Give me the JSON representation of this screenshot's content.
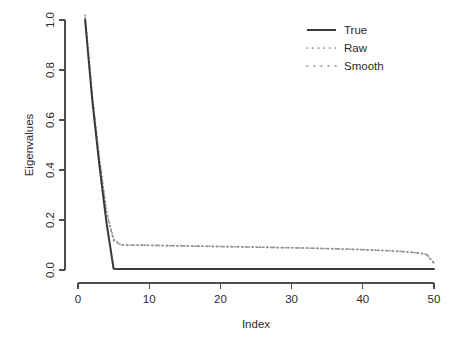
{
  "chart_data": {
    "type": "line",
    "title": "",
    "xlabel": "Index",
    "ylabel": "Eigenvalues",
    "xlim": [
      0,
      50
    ],
    "ylim": [
      0.0,
      1.0
    ],
    "grid": false,
    "legend_position": "top-right",
    "xticks": [
      "0",
      "10",
      "20",
      "30",
      "40",
      "50"
    ],
    "xtick_values": [
      0,
      10,
      20,
      30,
      40,
      50
    ],
    "yticks": [
      "0.0",
      "0.2",
      "0.4",
      "0.6",
      "0.8",
      "1.0"
    ],
    "ytick_values": [
      0.0,
      0.2,
      0.4,
      0.6,
      0.8,
      1.0
    ],
    "x": [
      1,
      2,
      3,
      4,
      5,
      6,
      7,
      8,
      9,
      10,
      11,
      12,
      13,
      14,
      15,
      16,
      17,
      18,
      19,
      20,
      21,
      22,
      23,
      24,
      25,
      26,
      27,
      28,
      29,
      30,
      31,
      32,
      33,
      34,
      35,
      36,
      37,
      38,
      39,
      40,
      41,
      42,
      43,
      44,
      45,
      46,
      47,
      48,
      49,
      50
    ],
    "series": [
      {
        "name": "True",
        "style": "solid",
        "color": "#3a3a3a",
        "values": [
          1.0,
          0.68,
          0.42,
          0.19,
          0.005,
          0.004,
          0.004,
          0.004,
          0.004,
          0.004,
          0.004,
          0.004,
          0.004,
          0.004,
          0.004,
          0.004,
          0.004,
          0.004,
          0.004,
          0.004,
          0.004,
          0.004,
          0.004,
          0.004,
          0.004,
          0.004,
          0.004,
          0.004,
          0.004,
          0.004,
          0.004,
          0.004,
          0.004,
          0.004,
          0.004,
          0.004,
          0.004,
          0.004,
          0.004,
          0.004,
          0.004,
          0.004,
          0.004,
          0.004,
          0.004,
          0.004,
          0.004,
          0.004,
          0.004,
          0.004
        ]
      },
      {
        "name": "Raw",
        "style": "dotted-fine",
        "color": "#9a9a9a",
        "values": [
          1.02,
          0.7,
          0.45,
          0.235,
          0.123,
          0.101,
          0.1,
          0.1,
          0.0995,
          0.099,
          0.0985,
          0.098,
          0.0975,
          0.097,
          0.0965,
          0.096,
          0.0955,
          0.095,
          0.0945,
          0.094,
          0.0935,
          0.093,
          0.0925,
          0.092,
          0.0915,
          0.091,
          0.0905,
          0.09,
          0.0895,
          0.089,
          0.0885,
          0.088,
          0.0872,
          0.0865,
          0.0857,
          0.085,
          0.0842,
          0.0833,
          0.0825,
          0.0815,
          0.0805,
          0.0793,
          0.078,
          0.0765,
          0.0748,
          0.0728,
          0.0705,
          0.068,
          0.062,
          0.028
        ]
      },
      {
        "name": "Smooth",
        "style": "dotted-coarse",
        "color": "#8a8a8a",
        "values": [
          1.01,
          0.695,
          0.443,
          0.228,
          0.118,
          0.1,
          0.0998,
          0.0995,
          0.0992,
          0.0988,
          0.0983,
          0.0978,
          0.0973,
          0.0968,
          0.0963,
          0.0958,
          0.0953,
          0.0948,
          0.0943,
          0.0938,
          0.0933,
          0.0928,
          0.0923,
          0.0918,
          0.0913,
          0.0908,
          0.0903,
          0.0898,
          0.0893,
          0.0888,
          0.0883,
          0.0877,
          0.087,
          0.0862,
          0.0855,
          0.0847,
          0.0839,
          0.0831,
          0.0822,
          0.0812,
          0.0802,
          0.079,
          0.0777,
          0.0762,
          0.0745,
          0.0725,
          0.0702,
          0.0676,
          0.0615,
          0.027
        ]
      }
    ]
  },
  "legend": {
    "entries": [
      {
        "label": "True"
      },
      {
        "label": "Raw"
      },
      {
        "label": "Smooth"
      }
    ]
  },
  "axes": {
    "x_title": "Index",
    "y_title": "Eigenvalues"
  }
}
